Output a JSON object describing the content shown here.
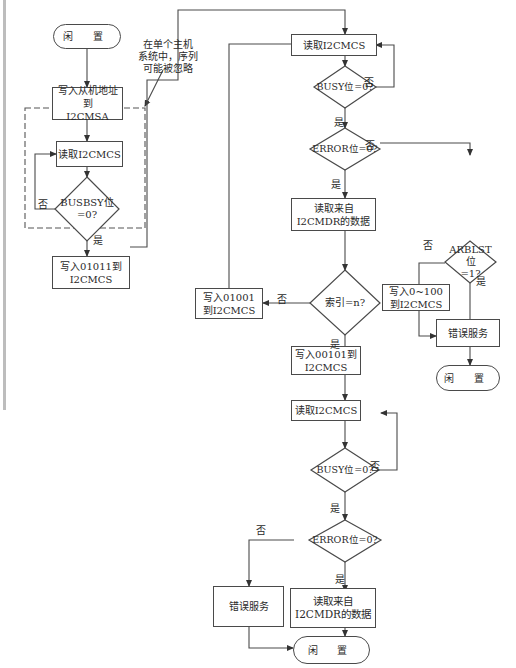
{
  "diagram": {
    "type": "flowchart",
    "colors": {
      "line": "#4a4a4a",
      "text": "#2a2a2a",
      "dashed_box": "#555555",
      "background": "#ffffff"
    },
    "labels": {
      "yes": "是",
      "no": "否"
    },
    "annotation": "在单个主机\n系统中，序列\n可能被忽略",
    "nodes": {
      "idle_start": "闲 置",
      "write_slave_addr": "写入从机地址到\nI2CMSA",
      "read_cmcs_1": "读取I2CMCS",
      "busbsy_check": "BUSBSY位\n=0?",
      "write_01011": "写入01011到\nI2CMCS",
      "read_cmcs_2": "读取I2CMCS",
      "busy_check_1": "BUSY位=0?",
      "error_check_1": "ERROR位=0?",
      "read_data_1": "读取来自\nI2CMDR的数据",
      "index_check": "索引=n?",
      "write_01001": "写入01001\n到I2CMCS",
      "arblst_check": "ARBLST位\n=1?",
      "write_0_100": "写入0~100\n到I2CMCS",
      "error_service_1": "错误服务",
      "idle_end_1": "闲 置",
      "write_00101": "写入00101到\nI2CMCS",
      "read_cmcs_3": "读取I2CMCS",
      "busy_check_2": "BUSY位=0?",
      "error_check_2": "ERROR位=0?",
      "error_service_2": "错误服务",
      "read_data_2": "读取来自\nI2CMDR的数据",
      "idle_end_2": "闲 置"
    }
  }
}
